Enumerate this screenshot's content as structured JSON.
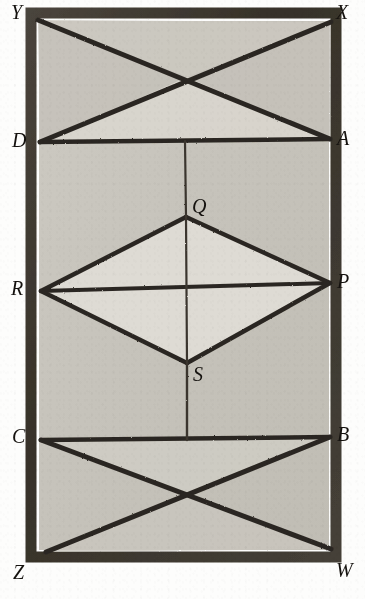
{
  "figure": {
    "canvas": {
      "width": 365,
      "height": 599
    },
    "colors": {
      "page_background": "#fdfdfc",
      "frame_stroke": "#3a352f",
      "interior_fill": "#c7c4bc",
      "rhombus_fill": "#dedbd4",
      "upper_triangle_fill": "#d6d3cb",
      "line_stroke": "#2c2823",
      "label_color": "#15120f"
    },
    "frame": {
      "outer": {
        "x": 30,
        "y": 12,
        "width": 309,
        "height": 548
      },
      "border_thickness": 9
    },
    "vertices": [
      {
        "id": "Y",
        "label": "Y",
        "role": "frame-corner-top-left",
        "x": 38,
        "y": 20,
        "label_x": 11,
        "label_y": 2
      },
      {
        "id": "X",
        "label": "X",
        "role": "frame-corner-top-right",
        "x": 331,
        "y": 22,
        "label_x": 336,
        "label_y": 2
      },
      {
        "id": "D",
        "label": "D",
        "role": "left-upper-division",
        "x": 40,
        "y": 142,
        "label_x": 12,
        "label_y": 130
      },
      {
        "id": "A",
        "label": "A",
        "role": "right-upper-division",
        "x": 330,
        "y": 139,
        "label_x": 337,
        "label_y": 128
      },
      {
        "id": "Q",
        "label": "Q",
        "role": "rhombus-top",
        "x": 186,
        "y": 217,
        "label_x": 192,
        "label_y": 196
      },
      {
        "id": "R",
        "label": "R",
        "role": "rhombus-left",
        "x": 41,
        "y": 291,
        "label_x": 11,
        "label_y": 278
      },
      {
        "id": "P",
        "label": "P",
        "role": "rhombus-right",
        "x": 330,
        "y": 283,
        "label_x": 337,
        "label_y": 271
      },
      {
        "id": "S",
        "label": "S",
        "role": "rhombus-bottom",
        "x": 187,
        "y": 363,
        "label_x": 193,
        "label_y": 364
      },
      {
        "id": "C",
        "label": "C",
        "role": "left-lower-division",
        "x": 41,
        "y": 440,
        "label_x": 12,
        "label_y": 426
      },
      {
        "id": "B",
        "label": "B",
        "role": "right-lower-division",
        "x": 330,
        "y": 437,
        "label_x": 337,
        "label_y": 424
      },
      {
        "id": "Z",
        "label": "Z",
        "role": "frame-corner-bottom-left",
        "x": 46,
        "y": 552,
        "label_x": 13,
        "label_y": 562
      },
      {
        "id": "W",
        "label": "W",
        "role": "frame-corner-bottom-right",
        "x": 331,
        "y": 549,
        "label_x": 336,
        "label_y": 560
      }
    ],
    "edges": [
      {
        "id": "YA",
        "from": "Y",
        "to": "A",
        "kind": "diagonal-heavy"
      },
      {
        "id": "XD",
        "from": "X",
        "to": "D",
        "kind": "diagonal-heavy"
      },
      {
        "id": "DA",
        "from": "D",
        "to": "A",
        "kind": "horizontal-heavy"
      },
      {
        "id": "QD-vertical",
        "from": "D-A midpoint",
        "to": "Q",
        "kind": "vertical-thin"
      },
      {
        "id": "RQ",
        "from": "R",
        "to": "Q",
        "kind": "rhombus-side"
      },
      {
        "id": "QP",
        "from": "Q",
        "to": "P",
        "kind": "rhombus-side"
      },
      {
        "id": "PS",
        "from": "P",
        "to": "S",
        "kind": "rhombus-side"
      },
      {
        "id": "SR",
        "from": "S",
        "to": "R",
        "kind": "rhombus-side"
      },
      {
        "id": "RP",
        "from": "R",
        "to": "P",
        "kind": "horizontal-heavy"
      },
      {
        "id": "QS",
        "from": "Q",
        "to": "S",
        "kind": "vertical-thin"
      },
      {
        "id": "SC-vertical",
        "from": "S",
        "to": "C-B midpoint",
        "kind": "vertical-thin"
      },
      {
        "id": "CB",
        "from": "C",
        "to": "B",
        "kind": "horizontal-heavy"
      },
      {
        "id": "CW",
        "from": "C",
        "to": "W",
        "kind": "diagonal-heavy"
      },
      {
        "id": "BZ",
        "from": "B",
        "to": "Z",
        "kind": "diagonal-heavy"
      }
    ],
    "crossings": [
      {
        "id": "upper-x",
        "x": 187,
        "y": 77,
        "of": [
          "YA",
          "XD"
        ]
      },
      {
        "id": "rhombus-center",
        "x": 186,
        "y": 287,
        "of": [
          "RP",
          "QS"
        ]
      },
      {
        "id": "lower-x",
        "x": 187,
        "y": 496,
        "of": [
          "CW",
          "BZ"
        ]
      }
    ]
  }
}
